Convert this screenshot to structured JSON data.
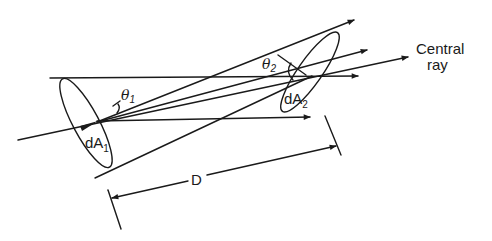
{
  "diagram": {
    "type": "geometric-optics",
    "labels": {
      "area1": {
        "main": "dA",
        "sub": "1"
      },
      "area2": {
        "main": "dA",
        "sub": "2"
      },
      "angle1": {
        "main": "θ",
        "sub": "1"
      },
      "angle2": {
        "main": "θ",
        "sub": "2"
      },
      "distance": "D",
      "central_ray_line1": "Central",
      "central_ray_line2": "ray"
    },
    "colors": {
      "stroke": "#1a1a1a",
      "background": "#ffffff"
    }
  }
}
